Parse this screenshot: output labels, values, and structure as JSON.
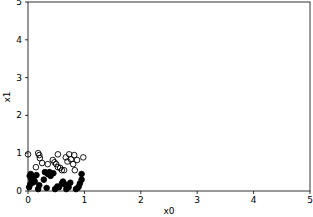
{
  "chart_data": {
    "type": "scatter",
    "title": "",
    "xlabel": "x0",
    "ylabel": "x1",
    "xlim": [
      0,
      5
    ],
    "ylim": [
      0,
      5
    ],
    "xticks": [
      "0",
      "1",
      "2",
      "3",
      "4",
      "5"
    ],
    "yticks": [
      "0",
      "1",
      "2",
      "3",
      "4",
      "5"
    ],
    "grid": false,
    "legend": null,
    "series": [
      {
        "name": "class-open",
        "marker": "open-circle",
        "color": "#000000",
        "points": [
          [
            0.0,
            0.97
          ],
          [
            0.18,
            1.0
          ],
          [
            0.21,
            0.87
          ],
          [
            0.25,
            0.74
          ],
          [
            0.14,
            0.63
          ],
          [
            0.35,
            0.71
          ],
          [
            0.44,
            0.82
          ],
          [
            0.53,
            0.97
          ],
          [
            0.5,
            0.71
          ],
          [
            0.57,
            0.61
          ],
          [
            0.64,
            0.55
          ],
          [
            0.67,
            0.89
          ],
          [
            0.73,
            0.97
          ],
          [
            0.76,
            0.84
          ],
          [
            0.8,
            0.71
          ],
          [
            0.82,
            0.95
          ],
          [
            0.87,
            0.82
          ],
          [
            0.83,
            0.55
          ],
          [
            0.98,
            0.89
          ],
          [
            0.53,
            0.63
          ],
          [
            0.2,
            0.95
          ],
          [
            0.7,
            0.78
          ],
          [
            0.47,
            0.76
          ],
          [
            0.6,
            0.55
          ]
        ]
      },
      {
        "name": "class-filled",
        "marker": "filled-circle",
        "color": "#000000",
        "points": [
          [
            0.03,
            0.4
          ],
          [
            0.05,
            0.45
          ],
          [
            0.06,
            0.3
          ],
          [
            0.08,
            0.22
          ],
          [
            0.04,
            0.18
          ],
          [
            0.1,
            0.35
          ],
          [
            0.12,
            0.25
          ],
          [
            0.02,
            0.1
          ],
          [
            0.15,
            0.42
          ],
          [
            0.3,
            0.5
          ],
          [
            0.35,
            0.45
          ],
          [
            0.38,
            0.5
          ],
          [
            0.4,
            0.4
          ],
          [
            0.45,
            0.47
          ],
          [
            0.28,
            0.3
          ],
          [
            0.33,
            0.08
          ],
          [
            0.48,
            0.05
          ],
          [
            0.55,
            0.1
          ],
          [
            0.6,
            0.2
          ],
          [
            0.65,
            0.18
          ],
          [
            0.62,
            0.25
          ],
          [
            0.7,
            0.15
          ],
          [
            0.72,
            0.1
          ],
          [
            0.75,
            0.22
          ],
          [
            0.85,
            0.05
          ],
          [
            0.9,
            0.12
          ],
          [
            0.92,
            0.2
          ],
          [
            0.95,
            0.3
          ],
          [
            0.95,
            0.45
          ],
          [
            0.88,
            0.08
          ],
          [
            0.2,
            0.15
          ],
          [
            0.18,
            0.05
          ],
          [
            0.52,
            0.12
          ],
          [
            0.68,
            0.05
          ]
        ]
      }
    ]
  }
}
